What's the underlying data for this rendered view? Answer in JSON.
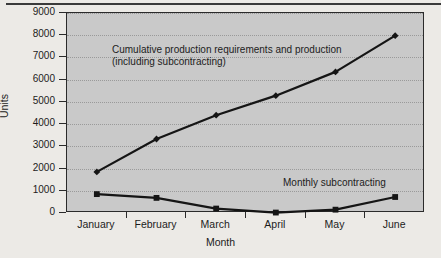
{
  "chart_data": {
    "type": "line",
    "title": "",
    "xlabel": "Month",
    "ylabel": "Units",
    "categories": [
      "January",
      "February",
      "March",
      "April",
      "May",
      "June"
    ],
    "ylim": [
      0,
      9000
    ],
    "ytick_labels": [
      "0",
      "1000",
      "2000",
      "3000",
      "4000",
      "5000",
      "6000",
      "7000",
      "8000",
      "9000"
    ],
    "ytick_values": [
      0,
      1000,
      2000,
      3000,
      4000,
      5000,
      6000,
      7000,
      8000,
      9000
    ],
    "grid": true,
    "legend_position": "inline-annotations",
    "series": [
      {
        "name": "Cumulative production requirements and production (including subcontracting)",
        "marker": "diamond",
        "color": "#151515",
        "values": [
          1850,
          3330,
          4400,
          5280,
          6350,
          7980
        ]
      },
      {
        "name": "Monthly subcontracting",
        "marker": "square",
        "color": "#151515",
        "values": [
          850,
          680,
          200,
          20,
          150,
          720
        ]
      }
    ],
    "annotations": [
      {
        "id": "cumulative",
        "line1": "Cumulative production requirements and production",
        "line2": "(including subcontracting)"
      },
      {
        "id": "subcontracting",
        "line1": "Monthly subcontracting"
      }
    ]
  },
  "figure": {
    "background_color": "#eceae6",
    "plot_background_color": "#c9c9c9",
    "axis_color": "#2b2b2b",
    "grid_color": "#9a9a9a",
    "series_color": "#151515"
  }
}
